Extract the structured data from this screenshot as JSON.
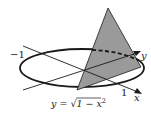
{
  "diagram": {
    "colors": {
      "stroke": "#1a1a1a",
      "triangle_fill": "#9a9a9a",
      "background": "#ffffff"
    },
    "labels": {
      "neg_one": "−1",
      "pos_one": "1",
      "x_axis": "x",
      "y_axis": "y",
      "curve_prefix": "y = ",
      "curve_radical": "√",
      "curve_radicand": "1 − x",
      "curve_exponent": "2"
    }
  }
}
